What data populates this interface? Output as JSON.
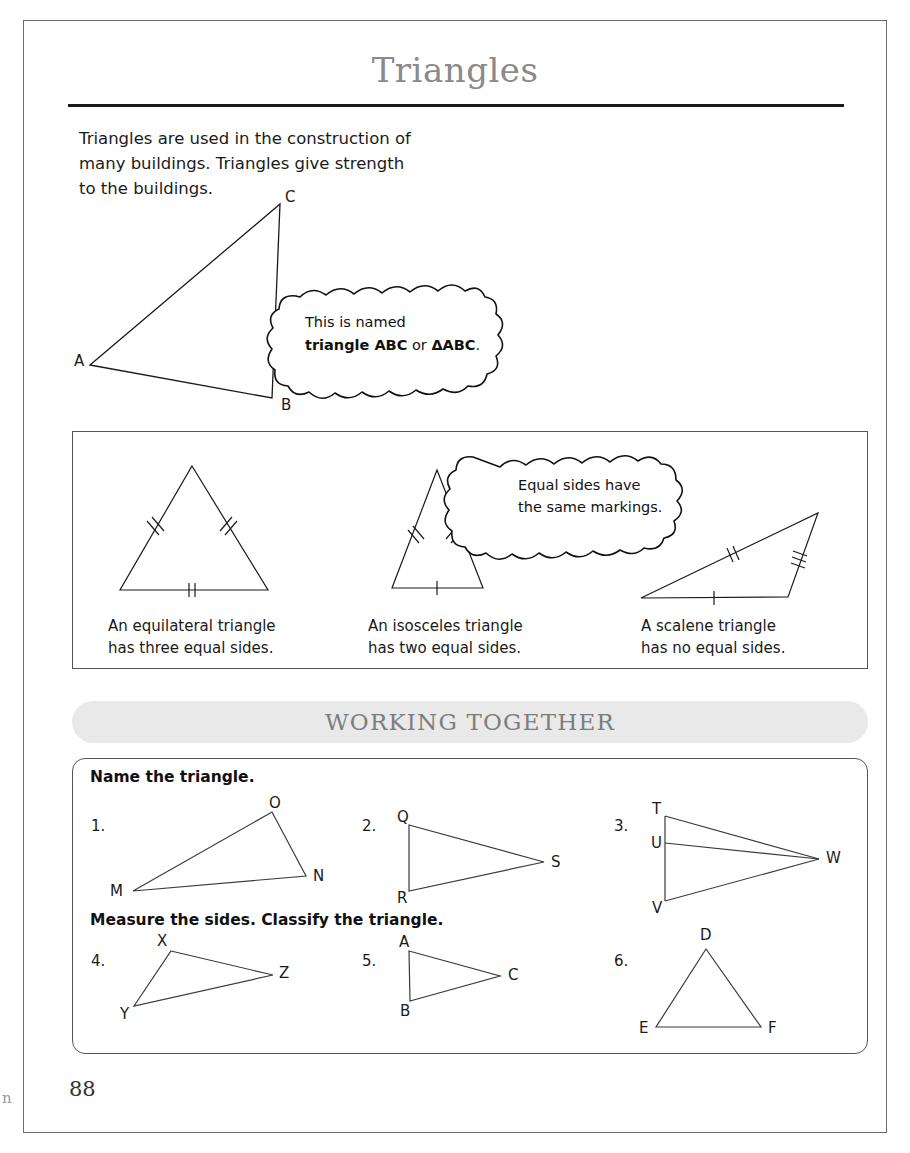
{
  "page": {
    "title": "Triangles",
    "number": "88",
    "edge_artifact": "n"
  },
  "intro": {
    "line1": "Triangles are used in the construction of",
    "line2": "many buildings. Triangles give strength",
    "line3": "to the buildings."
  },
  "main_figure": {
    "labels": {
      "a": "A",
      "b": "B",
      "c": "C"
    },
    "bubble": {
      "line1": "This is named",
      "line2_bold1": "triangle ABC",
      "line2_mid": " or ",
      "line2_bold2": "ΔABC",
      "line2_end": "."
    }
  },
  "types": {
    "bubble": {
      "line1": "Equal sides have",
      "line2": "the same markings."
    },
    "items": [
      {
        "name": "equilateral",
        "caption_line1": "An equilateral triangle",
        "caption_line2": "has three equal sides.",
        "marks": {
          "left": 2,
          "right": 2,
          "base": 2
        }
      },
      {
        "name": "isosceles",
        "caption_line1": "An isosceles triangle",
        "caption_line2": "has two equal sides.",
        "marks": {
          "left": 2,
          "right": 2,
          "base": 1
        }
      },
      {
        "name": "scalene",
        "caption_line1": "A scalene triangle",
        "caption_line2": "has no equal sides.",
        "marks": {
          "top": 2,
          "right": 3,
          "base": 1
        }
      }
    ]
  },
  "working_together": {
    "banner": "WORKING TOGETHER",
    "section1_heading": "Name the triangle.",
    "section2_heading": "Measure the sides. Classify the triangle.",
    "exercises": [
      {
        "number": "1.",
        "vertices": [
          "M",
          "N",
          "O"
        ]
      },
      {
        "number": "2.",
        "vertices": [
          "Q",
          "R",
          "S"
        ]
      },
      {
        "number": "3.",
        "vertices": [
          "T",
          "U",
          "V",
          "W"
        ]
      },
      {
        "number": "4.",
        "vertices": [
          "X",
          "Y",
          "Z"
        ]
      },
      {
        "number": "5.",
        "vertices": [
          "A",
          "B",
          "C"
        ]
      },
      {
        "number": "6.",
        "vertices": [
          "D",
          "E",
          "F"
        ]
      }
    ]
  },
  "colors": {
    "frame": "#6d6d6d",
    "rule": "#1a1a1a",
    "title_gray": "#8a8a8a",
    "banner_bg": "#e9e9e9",
    "banner_text": "#7d7d7d",
    "stroke": "#1a1a1a"
  }
}
